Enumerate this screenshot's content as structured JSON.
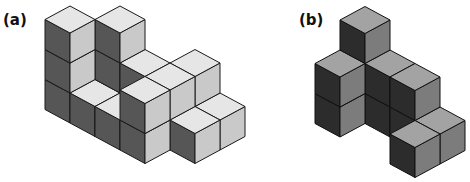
{
  "figures": [
    {
      "label": "(a)",
      "origin": [
        45,
        109.5
      ],
      "colors": {
        "top": "#e6e6e6",
        "left": "#565656",
        "right": "#c9c9c9",
        "stroke": "#1a1a1a"
      },
      "cubes": [
        [
          0,
          0,
          0
        ],
        [
          0,
          0,
          1
        ],
        [
          0,
          0,
          2
        ],
        [
          0,
          1,
          0
        ],
        [
          0,
          1,
          1
        ],
        [
          1,
          1,
          0
        ],
        [
          1,
          1,
          1
        ],
        [
          1,
          1,
          2
        ],
        [
          1,
          0,
          0
        ],
        [
          2,
          0,
          0
        ],
        [
          3,
          0,
          0
        ],
        [
          3,
          0,
          1
        ],
        [
          2,
          1,
          0
        ],
        [
          2,
          1,
          1
        ],
        [
          3,
          1,
          0
        ],
        [
          3,
          1,
          1
        ],
        [
          2,
          2,
          0
        ],
        [
          3,
          2,
          0
        ],
        [
          3,
          2,
          1
        ],
        [
          4,
          1,
          0
        ],
        [
          4,
          2,
          0
        ]
      ]
    },
    {
      "label": "(b)",
      "origin": [
        315,
        123.5
      ],
      "colors": {
        "top": "#a3a3a3",
        "left": "#2c2c2c",
        "right": "#7c7c7c",
        "stroke": "#111111"
      },
      "cubes": [
        [
          0,
          0,
          0
        ],
        [
          0,
          0,
          1
        ],
        [
          0,
          1,
          0
        ],
        [
          0,
          1,
          1
        ],
        [
          0,
          1,
          2
        ],
        [
          1,
          1,
          0
        ],
        [
          1,
          1,
          1
        ],
        [
          2,
          1,
          0
        ],
        [
          2,
          1,
          1
        ],
        [
          3,
          1,
          0
        ],
        [
          3,
          0,
          0
        ]
      ]
    }
  ],
  "projection": {
    "e1": [
      25,
      13.5
    ],
    "e2": [
      25,
      -13.5
    ],
    "height": 30
  }
}
